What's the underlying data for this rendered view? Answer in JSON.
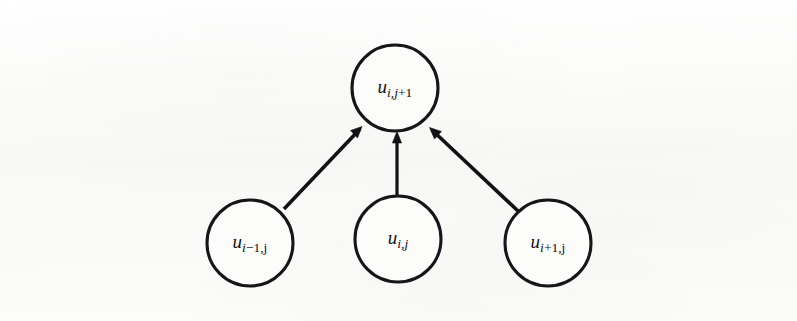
{
  "figure": {
    "kind": "stencil-diagram",
    "background_color": "#fbfbfa",
    "stroke_color": "#121216",
    "nodes": [
      {
        "id": "node-top",
        "name": "node-u-i-j-plus-1",
        "label_full": "u i,j+1",
        "base": "u",
        "sub_main": "i,j",
        "sub_tail": "+1",
        "cx": 395,
        "cy": 88,
        "r": 43,
        "role": "target"
      },
      {
        "id": "node-left",
        "name": "node-u-i-minus-1-j",
        "label_full": "u i-1,j",
        "base": "u",
        "sub_main": "i",
        "sub_tail": "−1,j",
        "cx": 250,
        "cy": 243,
        "r": 43,
        "role": "source"
      },
      {
        "id": "node-middle",
        "name": "node-u-i-j",
        "label_full": "u i,j",
        "base": "u",
        "sub_main": "i,j",
        "sub_tail": "",
        "cx": 398,
        "cy": 239,
        "r": 43,
        "role": "source"
      },
      {
        "id": "node-right",
        "name": "node-u-i-plus-1-j",
        "label_full": "u i+1,j",
        "base": "u",
        "sub_main": "i",
        "sub_tail": "+1,j",
        "cx": 548,
        "cy": 243,
        "r": 43,
        "role": "source"
      }
    ],
    "edges": [
      {
        "id": "edge-left",
        "name": "arrow-left-to-top",
        "from": "node-left",
        "to": "node-top",
        "x1": 284,
        "y1": 209,
        "x2": 362,
        "y2": 127
      },
      {
        "id": "edge-middle",
        "name": "arrow-middle-to-top",
        "from": "node-middle",
        "to": "node-top",
        "x1": 397,
        "y1": 196,
        "x2": 397,
        "y2": 132
      },
      {
        "id": "edge-right",
        "name": "arrow-right-to-top",
        "from": "node-right",
        "to": "node-top",
        "x1": 518,
        "y1": 211,
        "x2": 430,
        "y2": 128
      }
    ]
  }
}
